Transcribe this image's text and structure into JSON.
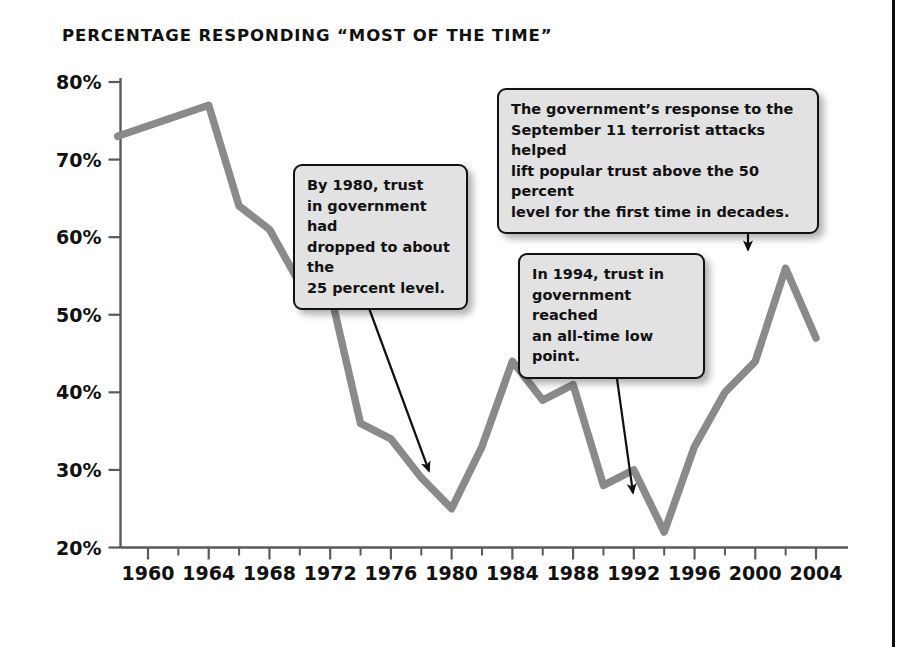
{
  "page": {
    "title": "PERCENTAGE RESPONDING “MOST OF THE TIME”",
    "background_color": "#ffffff",
    "rule_color": "#0d0d0d"
  },
  "chart_data": {
    "type": "line",
    "title": "PERCENTAGE RESPONDING “MOST OF THE TIME”",
    "xlabel": "",
    "ylabel": "",
    "xlim": [
      1958,
      2005
    ],
    "ylim": [
      20,
      80
    ],
    "grid": false,
    "legend": "none",
    "line_color": "#8a8a8a",
    "axis_color": "#5a5a5a",
    "xticks": [
      "1960",
      "1964",
      "1968",
      "1972",
      "1976",
      "1980",
      "1984",
      "1988",
      "1992",
      "1996",
      "2000",
      "2004"
    ],
    "xtick_values": [
      1960,
      1964,
      1968,
      1972,
      1976,
      1980,
      1984,
      1988,
      1992,
      1996,
      2000,
      2004
    ],
    "yticks": [
      "20%",
      "30%",
      "40%",
      "50%",
      "60%",
      "70%",
      "80%"
    ],
    "ytick_values": [
      20,
      30,
      40,
      50,
      60,
      70,
      80
    ],
    "x": [
      1958,
      1964,
      1966,
      1968,
      1970,
      1972,
      1974,
      1976,
      1978,
      1980,
      1982,
      1984,
      1986,
      1988,
      1990,
      1992,
      1994,
      1996,
      1998,
      2000,
      2002,
      2004
    ],
    "values": [
      73,
      77,
      64,
      61,
      54,
      53,
      36,
      34,
      29,
      25,
      33,
      44,
      39,
      41,
      28,
      30,
      22,
      33,
      40,
      44,
      56,
      47
    ],
    "series": [
      {
        "name": "Trust in government – most of the time",
        "x": [
          1958,
          1964,
          1966,
          1968,
          1970,
          1972,
          1974,
          1976,
          1978,
          1980,
          1982,
          1984,
          1986,
          1988,
          1990,
          1992,
          1994,
          1996,
          1998,
          2000,
          2002,
          2004
        ],
        "values": [
          73,
          77,
          64,
          61,
          54,
          53,
          36,
          34,
          29,
          25,
          33,
          44,
          39,
          41,
          28,
          30,
          22,
          33,
          40,
          44,
          56,
          47
        ]
      }
    ],
    "annotations": [
      {
        "id": "callout-1980",
        "text": "By 1980, trust\nin government had\ndropped to about the\n25 percent level.",
        "points_to_year": 1980,
        "points_to_value": 25
      },
      {
        "id": "callout-911",
        "text": "The government’s response to the\nSeptember 11 terrorist attacks helped\nlift popular trust above the 50 percent\nlevel for the first time in decades.",
        "points_to_year": 2002,
        "points_to_value": 56
      },
      {
        "id": "callout-1994",
        "text": "In 1994, trust in\ngovernment reached\nan all-time low point.",
        "points_to_year": 1994,
        "points_to_value": 22
      }
    ]
  }
}
